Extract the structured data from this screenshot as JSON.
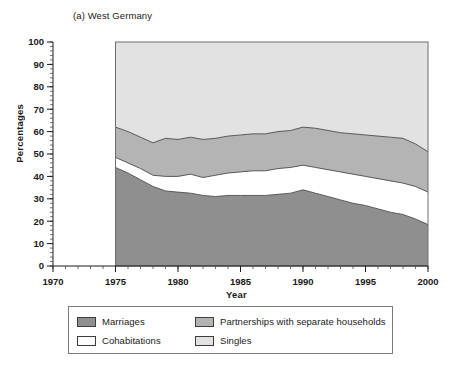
{
  "chart_data": {
    "type": "area",
    "title": "(a) West Germany",
    "xlabel": "Year",
    "ylabel": "Percentages",
    "xlim": [
      1970,
      2000
    ],
    "ylim": [
      0,
      100
    ],
    "grid": false,
    "stacked": true,
    "legend_position": "bottom",
    "x_major_ticks": [
      1970,
      1975,
      1980,
      1985,
      1990,
      1995,
      2000
    ],
    "x_tick_labels": [
      "1970",
      "1975",
      "1980",
      "1985",
      "1990",
      "1995",
      "2000"
    ],
    "x_minor_tick_interval": 1,
    "y_major_ticks": [
      0,
      10,
      20,
      30,
      40,
      50,
      60,
      70,
      80,
      90,
      100
    ],
    "y_tick_labels": [
      "0",
      "10",
      "20",
      "30",
      "40",
      "50",
      "60",
      "70",
      "80",
      "90",
      "100"
    ],
    "y_minor_tick_interval": 2,
    "x": [
      1975,
      1976,
      1977,
      1978,
      1979,
      1980,
      1981,
      1982,
      1983,
      1984,
      1985,
      1986,
      1987,
      1988,
      1989,
      1990,
      1991,
      1992,
      1993,
      1994,
      1995,
      1996,
      1997,
      1998,
      1999,
      2000
    ],
    "series": [
      {
        "name": "Marriages",
        "color": "#8f8f8f",
        "values": [
          44.0,
          41.5,
          38.5,
          35.5,
          33.5,
          33.0,
          32.5,
          31.5,
          31.0,
          31.5,
          31.5,
          31.5,
          31.5,
          32.0,
          32.5,
          34.0,
          32.5,
          31.0,
          29.5,
          28.0,
          27.0,
          25.5,
          24.0,
          23.0,
          21.0,
          18.5
        ]
      },
      {
        "name": "Cohabitations",
        "color": "#ffffff",
        "values": [
          4.5,
          4.5,
          5.0,
          5.0,
          6.5,
          7.0,
          8.5,
          8.0,
          9.5,
          10.0,
          10.5,
          11.0,
          11.0,
          11.5,
          11.5,
          11.0,
          11.5,
          12.0,
          12.5,
          13.0,
          13.0,
          13.5,
          14.0,
          14.0,
          14.5,
          14.5
        ]
      },
      {
        "name": "Partnerships with separate households",
        "color": "#b4b4b4",
        "values": [
          13.5,
          14.0,
          14.0,
          14.5,
          17.0,
          16.5,
          16.5,
          17.0,
          16.5,
          16.5,
          16.5,
          16.5,
          16.5,
          16.5,
          16.5,
          17.0,
          17.5,
          17.5,
          17.5,
          18.0,
          18.5,
          19.0,
          19.5,
          20.0,
          19.0,
          18.0
        ]
      },
      {
        "name": "Singles",
        "color": "#e2e2e2",
        "values": [
          38.0,
          40.0,
          42.5,
          45.0,
          43.0,
          43.5,
          42.5,
          43.5,
          43.0,
          42.0,
          41.5,
          41.0,
          41.0,
          40.0,
          39.5,
          38.0,
          38.5,
          39.5,
          40.5,
          41.0,
          41.5,
          42.0,
          42.5,
          43.0,
          45.5,
          49.0
        ]
      }
    ],
    "cumulative_boundaries": {
      "marriages_top": [
        44.0,
        41.5,
        38.5,
        35.5,
        33.5,
        33.0,
        32.5,
        31.5,
        31.0,
        31.5,
        31.5,
        31.5,
        31.5,
        32.0,
        32.5,
        34.0,
        32.5,
        31.0,
        29.5,
        28.0,
        27.0,
        25.5,
        24.0,
        23.0,
        21.0,
        18.5
      ],
      "cohabitations_top": [
        48.5,
        46.0,
        43.5,
        40.5,
        40.0,
        40.0,
        41.0,
        39.5,
        40.5,
        41.5,
        42.0,
        42.5,
        42.5,
        43.5,
        44.0,
        45.0,
        44.0,
        43.0,
        42.0,
        41.0,
        40.0,
        39.0,
        38.0,
        37.0,
        35.5,
        33.0
      ],
      "partnerships_top": [
        62.0,
        60.0,
        57.5,
        55.0,
        57.0,
        56.5,
        57.5,
        56.5,
        57.0,
        58.0,
        58.5,
        59.0,
        59.0,
        60.0,
        60.5,
        62.0,
        61.5,
        60.5,
        59.5,
        59.0,
        58.5,
        58.0,
        57.5,
        57.0,
        54.5,
        51.0
      ],
      "singles_top": [
        100,
        100,
        100,
        100,
        100,
        100,
        100,
        100,
        100,
        100,
        100,
        100,
        100,
        100,
        100,
        100,
        100,
        100,
        100,
        100,
        100,
        100,
        100,
        100,
        100,
        100
      ]
    }
  },
  "legend": {
    "items": [
      {
        "label": "Marriages",
        "color": "#8f8f8f"
      },
      {
        "label": "Partnerships with separate households",
        "color": "#b4b4b4"
      },
      {
        "label": "Cohabitations",
        "color": "#ffffff"
      },
      {
        "label": "Singles",
        "color": "#e2e2e2"
      }
    ]
  }
}
